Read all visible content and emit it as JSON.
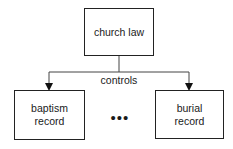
{
  "diagram": {
    "parent": {
      "label": "church law"
    },
    "relation": {
      "label": "controls"
    },
    "children": [
      {
        "label_line1": "baptism",
        "label_line2": "record"
      },
      {
        "label_line1": "burial",
        "label_line2": "record"
      }
    ],
    "ellipsis": "•••",
    "colors": {
      "stroke": "#222222",
      "background": "#ffffff"
    }
  }
}
